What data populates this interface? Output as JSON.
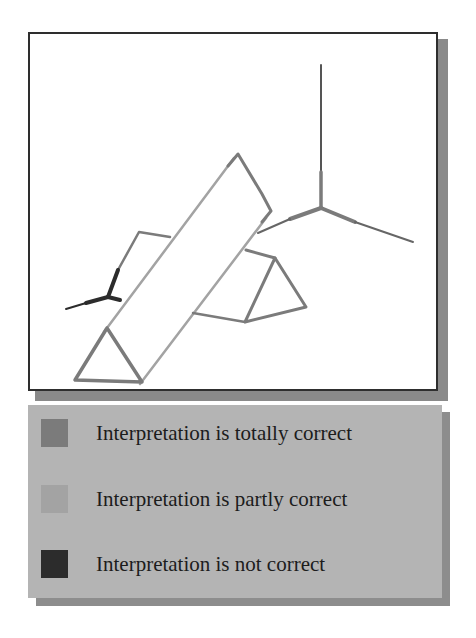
{
  "diagram": {
    "colors": {
      "totally_correct": "#7b7b7b",
      "partly_correct": "#a3a3a3",
      "not_correct": "#2c2c2c",
      "thin_line": "#555555",
      "frame_border": "#2e2e2e",
      "legend_background": "#b4b4b4"
    },
    "segments": [
      {
        "id": "vertical-axis",
        "points": [
          [
            321,
            65
          ],
          [
            321,
            208
          ]
        ],
        "status": "not_correct_thin"
      },
      {
        "id": "vertical-axis-base",
        "points": [
          [
            321,
            172
          ],
          [
            321,
            208
          ]
        ],
        "status": "totally_correct"
      },
      {
        "id": "axis-right-branch",
        "points": [
          [
            321,
            208
          ],
          [
            413,
            242
          ]
        ],
        "status": "totally_correct"
      },
      {
        "id": "axis-left-branch",
        "points": [
          [
            321,
            208
          ],
          [
            258,
            233
          ]
        ],
        "status": "totally_correct"
      },
      {
        "id": "band-upper-edge",
        "points": [
          [
            238,
            154
          ],
          [
            108,
            328
          ]
        ],
        "status": "partly_correct"
      },
      {
        "id": "band-lower-edge",
        "points": [
          [
            271,
            211
          ],
          [
            142,
            382
          ]
        ],
        "status": "partly_correct"
      },
      {
        "id": "band-top-left-side",
        "points": [
          [
            238,
            154
          ],
          [
            228,
            163
          ]
        ],
        "status": "totally_correct"
      },
      {
        "id": "band-top-right-side",
        "points": [
          [
            238,
            154
          ],
          [
            271,
            211
          ]
        ],
        "status": "totally_correct"
      },
      {
        "id": "triangle-left",
        "points": [
          [
            107,
            328
          ],
          [
            75,
            380
          ],
          [
            142,
            382
          ],
          [
            107,
            328
          ]
        ],
        "status": "totally_correct"
      },
      {
        "id": "triangle-right",
        "points": [
          [
            248,
            254
          ],
          [
            275,
            258
          ],
          [
            306,
            307
          ],
          [
            245,
            322
          ],
          [
            275,
            258
          ]
        ],
        "status": "totally_correct"
      },
      {
        "id": "triangle-right-top-link",
        "points": [
          [
            248,
            254
          ],
          [
            275,
            258
          ]
        ],
        "status": "partly_correct"
      },
      {
        "id": "triangle-right-bottom-link",
        "points": [
          [
            193,
            313
          ],
          [
            245,
            322
          ]
        ],
        "status": "totally_correct"
      },
      {
        "id": "left-arm",
        "points": [
          [
            170,
            237
          ],
          [
            139,
            232
          ],
          [
            108,
            297
          ]
        ],
        "status": "totally_correct"
      },
      {
        "id": "left-y-stem",
        "points": [
          [
            108,
            297
          ],
          [
            118,
            270
          ]
        ],
        "status": "not_correct"
      },
      {
        "id": "left-y-tail",
        "points": [
          [
            108,
            297
          ],
          [
            66,
            309
          ]
        ],
        "status": "not_correct"
      },
      {
        "id": "left-y-link",
        "points": [
          [
            108,
            297
          ],
          [
            120,
            300
          ]
        ],
        "status": "not_correct"
      }
    ]
  },
  "legend": {
    "items": [
      {
        "label": "Interpretation is totally correct",
        "color": "#7b7b7b"
      },
      {
        "label": "Interpretation is partly correct",
        "color": "#a3a3a3"
      },
      {
        "label": "Interpretation is not correct",
        "color": "#2c2c2c"
      }
    ]
  }
}
